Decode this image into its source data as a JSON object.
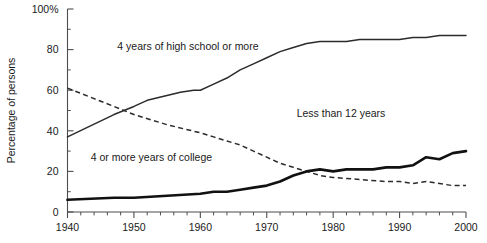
{
  "chart_data": {
    "type": "line",
    "title": "",
    "xlabel": "",
    "ylabel": "Percentage of persons",
    "xlim": [
      1940,
      2000
    ],
    "ylim": [
      0,
      100
    ],
    "grid": false,
    "legend_position": "inline-annotations",
    "x_ticks": [
      1940,
      1950,
      1960,
      1970,
      1980,
      1990,
      2000
    ],
    "x_tick_labels": [
      "1940",
      "1950",
      "1960",
      "1970",
      "1980",
      "1990",
      "2000"
    ],
    "x_minor_tick_step": 2,
    "y_ticks": [
      0,
      20,
      40,
      60,
      80,
      100
    ],
    "y_tick_labels": [
      "0",
      "20",
      "40",
      "60",
      "80",
      "100%"
    ],
    "y_minor_tick_step": 10,
    "annotations": [
      {
        "text": "4 years of high school or more",
        "x": 1947.5,
        "y": 80
      },
      {
        "text": "Less than 12 years",
        "x": 1974.5,
        "y": 47
      },
      {
        "text": "4 or more years of college",
        "x": 1943.5,
        "y": 25
      }
    ],
    "series": [
      {
        "name": "4 years of high school or more",
        "style": "solid",
        "width": "thin",
        "color": "#2b2b2b",
        "x": [
          1940,
          1947,
          1950,
          1952,
          1957,
          1959,
          1960,
          1962,
          1964,
          1966,
          1968,
          1970,
          1972,
          1974,
          1976,
          1978,
          1980,
          1982,
          1984,
          1986,
          1988,
          1990,
          1992,
          1994,
          1996,
          1998,
          2000
        ],
        "values": [
          37,
          48,
          52,
          55,
          59,
          60,
          60,
          63,
          66,
          70,
          73,
          76,
          79,
          81,
          83,
          84,
          84,
          84,
          85,
          85,
          85,
          85,
          86,
          86,
          87,
          87,
          87
        ]
      },
      {
        "name": "Less than 12 years",
        "style": "dashed",
        "width": "thin",
        "color": "#2b2b2b",
        "x": [
          1940,
          1947,
          1950,
          1955,
          1960,
          1962,
          1964,
          1966,
          1968,
          1970,
          1972,
          1974,
          1976,
          1978,
          1980,
          1984,
          1988,
          1990,
          1992,
          1994,
          1996,
          1998,
          2000
        ],
        "values": [
          61,
          52,
          48,
          43,
          39,
          37,
          35,
          33,
          30,
          27,
          24,
          22,
          20,
          18,
          17,
          16,
          15,
          15,
          14,
          15,
          14,
          13,
          13
        ]
      },
      {
        "name": "4 or more years of college",
        "style": "solid",
        "width": "thick",
        "color": "#111111",
        "x": [
          1940,
          1947,
          1950,
          1955,
          1960,
          1962,
          1964,
          1966,
          1968,
          1970,
          1972,
          1974,
          1976,
          1978,
          1980,
          1982,
          1984,
          1986,
          1988,
          1990,
          1992,
          1994,
          1996,
          1998,
          2000
        ],
        "values": [
          6,
          7,
          7,
          8,
          9,
          10,
          10,
          11,
          12,
          13,
          15,
          18,
          20,
          21,
          20,
          21,
          21,
          21,
          22,
          22,
          23,
          27,
          26,
          29,
          30
        ]
      }
    ]
  },
  "axis": {
    "y_title": "Percentage of persons"
  }
}
